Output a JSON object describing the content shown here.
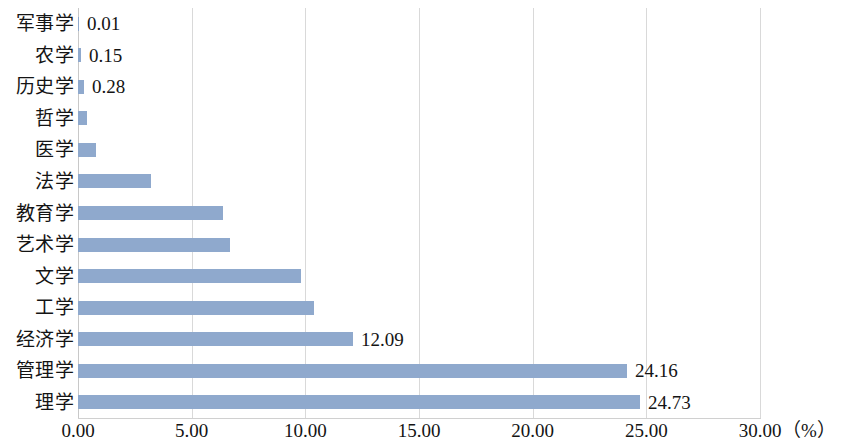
{
  "chart_data": {
    "type": "bar",
    "orientation": "horizontal",
    "title": "",
    "subtitle": "",
    "xlabel": "",
    "ylabel": "",
    "unit_label": "（%）",
    "xlim": [
      0,
      30
    ],
    "xticks": [
      0,
      5,
      10,
      15,
      20,
      25,
      30
    ],
    "xtick_labels": [
      "0.00",
      "5.00",
      "10.00",
      "15.00",
      "20.00",
      "25.00",
      "30.00"
    ],
    "grid": true,
    "grid_axis": "x",
    "legend": false,
    "legend_position": "none",
    "bar_color": "#8fa9cd",
    "grid_color": "#d9d9d9",
    "categories": [
      "军事学",
      "农学",
      "历史学",
      "哲学",
      "医学",
      "法学",
      "教育学",
      "艺术学",
      "文学",
      "工学",
      "经济学",
      "管理学",
      "理学"
    ],
    "values": [
      0.01,
      0.15,
      0.28,
      0.4,
      0.8,
      3.2,
      6.4,
      6.7,
      9.8,
      10.4,
      12.09,
      24.16,
      24.73
    ],
    "data_labels": [
      "0.01",
      "0.15",
      "0.28",
      "",
      "",
      "",
      "",
      "",
      "",
      "",
      "12.09",
      "24.16",
      "24.73"
    ]
  }
}
